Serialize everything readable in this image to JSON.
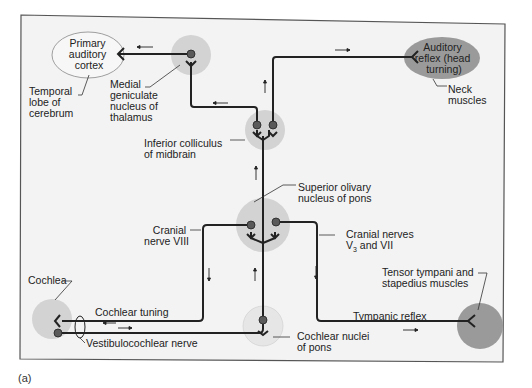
{
  "figure": {
    "panel_label": "(a)",
    "colors": {
      "background": "#ffffff",
      "panel_fill": "#f3f3f3",
      "panel_border": "#555555",
      "nucleus_fill": "#d3d3d3",
      "effector_fill": "#9a9a9a",
      "cortex_fill": "#f7f7f7",
      "pathway": "#222222"
    }
  },
  "labels": {
    "cortex": [
      "Primary",
      "auditory",
      "cortex"
    ],
    "temporal_lobe": [
      "Temporal",
      "lobe of",
      "cerebrum"
    ],
    "medial_geniculate": [
      "Medial",
      "geniculate",
      "nucleus of",
      "thalamus"
    ],
    "inferior_colliculus": [
      "Inferior colliculus",
      "of midbrain"
    ],
    "auditory_reflex": [
      "Auditory",
      "reflex (head",
      "turning)"
    ],
    "neck_muscles": [
      "Neck",
      "muscles"
    ],
    "superior_olivary": [
      "Superior olivary",
      "nucleus of pons"
    ],
    "cranial_nerve_viii": [
      "Cranial",
      "nerve VIII"
    ],
    "cranial_nerves_v3_vii": {
      "line1": "Cranial nerves",
      "line2_prefix": "V",
      "line2_sub": "3",
      "line2_suffix": " and VII"
    },
    "tensor_tympani": [
      "Tensor tympani and",
      "stapedius muscles"
    ],
    "cochlea": "Cochlea",
    "cochlear_tuning": "Cochlear tuning",
    "vestibulocochlear_nerve": "Vestibulocochlear nerve",
    "tympanic_reflex": "Tympanic reflex",
    "cochlear_nuclei": [
      "Cochlear nuclei",
      "of pons"
    ]
  },
  "arrows": {
    "left": "←",
    "right": "→",
    "up": "↑",
    "down": "↓"
  }
}
